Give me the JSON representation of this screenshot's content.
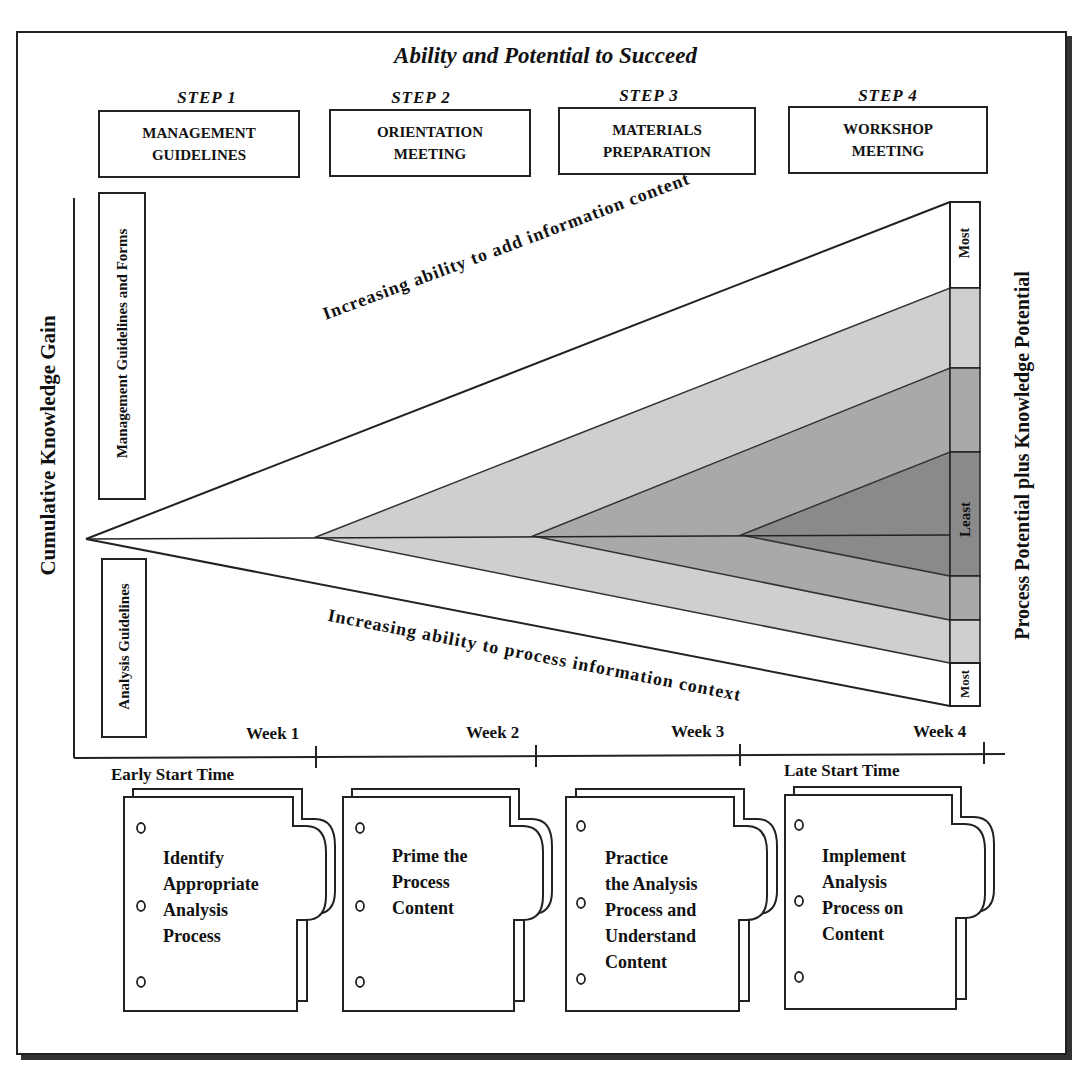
{
  "diagram": {
    "title": "Ability and Potential to Succeed",
    "steps": [
      {
        "label": "STEP 1",
        "box": "MANAGEMENT\nGUIDELINES"
      },
      {
        "label": "STEP 2",
        "box": "ORIENTATION\nMEETING"
      },
      {
        "label": "STEP 3",
        "box": "MATERIALS\nPREPARATION"
      },
      {
        "label": "STEP 4",
        "box": "WORKSHOP\nMEETING"
      }
    ],
    "y_axis_label": "Cumulative Knowledge Gain",
    "left_boxes": {
      "upper": "Management Guidelines and Forms",
      "lower": "Analysis Guidelines"
    },
    "right_axis_label": "Process Potential plus Knowledge Potential",
    "right_scale": {
      "top": "Most",
      "middle": "Least",
      "bottom": "Most"
    },
    "diagonal_labels": {
      "upper": "Increasing ability to add information content",
      "lower": "Increasing ability to process information context"
    },
    "timeline": {
      "weeks": [
        "Week 1",
        "Week 2",
        "Week 3",
        "Week 4"
      ],
      "early_start": "Early Start Time",
      "late_start": "Late Start Time"
    },
    "cards": [
      {
        "text": "Identify\nAppropriate\nAnalysis\nProcess"
      },
      {
        "text": "Prime the\nProcess\nContent"
      },
      {
        "text": "Practice\nthe Analysis\nProcess and\nUnderstand\nContent"
      },
      {
        "text": "Implement\nAnalysis\nProcess on\nContent"
      }
    ],
    "colors": {
      "frame": "#222222",
      "band_light": "#cfcfcf",
      "band_mid": "#a9a9a9",
      "band_dark": "#8a8a8a",
      "background": "#ffffff"
    }
  }
}
